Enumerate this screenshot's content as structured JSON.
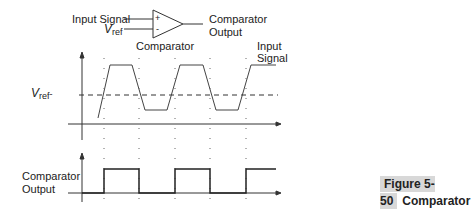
{
  "schematic": {
    "input_signal_label": "Input Signal",
    "vref_label_v": "V",
    "vref_label_sub": "ref",
    "plus_sign": "+",
    "minus_sign": "-",
    "comparator_label": "Comparator",
    "output_label_line1": "Comparator",
    "output_label_line2": "Output"
  },
  "top_plot": {
    "vref_label_v": "V",
    "vref_label_sub": "ref",
    "signal_label_line1": "Input",
    "signal_label_line2": "Signal"
  },
  "bottom_plot": {
    "output_label_line1": "Comparator",
    "output_label_line2": "Output"
  },
  "caption": {
    "figure_number": "Figure 5-50",
    "title_line1": "Comparator",
    "title_line2": "response"
  },
  "colors": {
    "line": "#333333",
    "caption_highlight": "#d8d8d8"
  }
}
